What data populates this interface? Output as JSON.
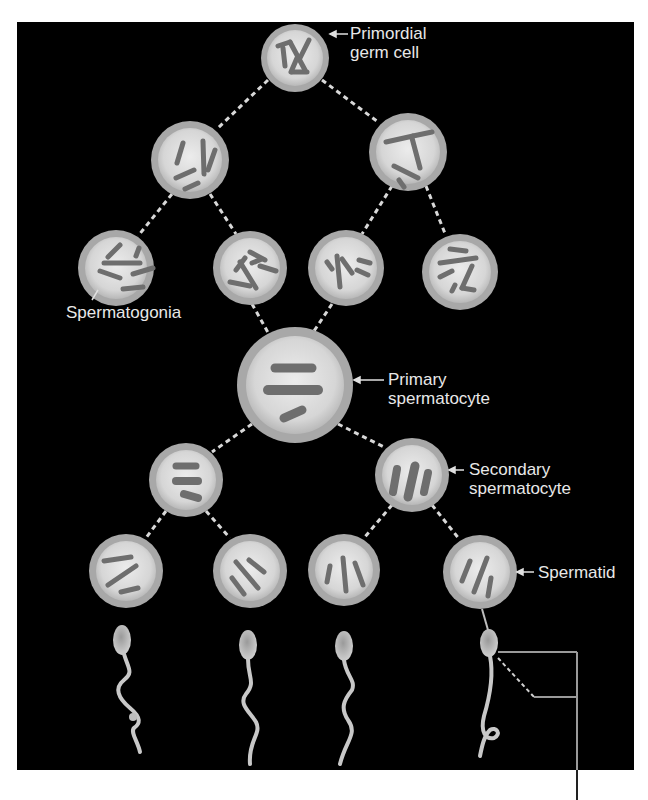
{
  "diagram": {
    "colors": {
      "background": "#000000",
      "page": "#ffffff",
      "cell_membrane": "#9a9a9a",
      "cell_cytoplasm": "#dcdcdc",
      "chromosome": "#6e6e6e",
      "label_text": "#e8e8e8",
      "connector": "#d0d0d0"
    },
    "labels": {
      "primordial_line1": "Primordial",
      "primordial_line2": "germ cell",
      "spermatogonia": "Spermatogonia",
      "primary_line1": "Primary",
      "primary_line2": "spermatocyte",
      "secondary_line1": "Secondary",
      "secondary_line2": "spermatocyte",
      "spermatid": "Spermatid"
    },
    "stages": [
      {
        "name": "Primordial germ cell",
        "count": 1
      },
      {
        "name": "Spermatogonia (mitosis)",
        "count": 2
      },
      {
        "name": "Spermatogonia",
        "count": 4
      },
      {
        "name": "Primary spermatocyte",
        "count": 1
      },
      {
        "name": "Secondary spermatocyte",
        "count": 2
      },
      {
        "name": "Spermatid",
        "count": 4
      },
      {
        "name": "Sperm",
        "count": 4
      }
    ]
  }
}
